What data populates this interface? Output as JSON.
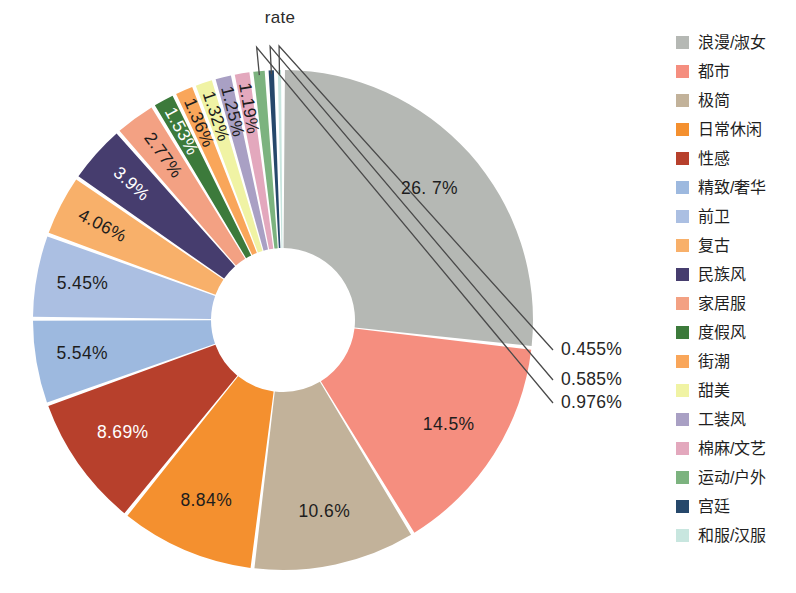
{
  "chart": {
    "title": "rate",
    "center_x": 283,
    "center_y": 320,
    "outer_radius": 250,
    "inner_radius": 72
  },
  "chart_data": {
    "type": "pie",
    "variant": "donut",
    "title": "rate",
    "xlabel": "",
    "ylabel": "",
    "legend_position": "right",
    "grid": false,
    "start_angle_deg": -90,
    "direction": "clockwise",
    "units": "percent",
    "categories": [
      "浪漫/淑女",
      "都市",
      "极简",
      "日常休闲",
      "性感",
      "精致/奢华",
      "前卫",
      "复古",
      "民族风",
      "家居服",
      "度假风",
      "街潮",
      "甜美",
      "工装风",
      "棉麻/文艺",
      "运动/户外",
      "宫廷",
      "和服/汉服"
    ],
    "values": [
      26.7,
      14.5,
      10.6,
      8.84,
      8.69,
      5.54,
      5.45,
      4.06,
      3.9,
      2.77,
      1.53,
      1.36,
      1.32,
      1.25,
      1.19,
      0.976,
      0.585,
      0.455
    ],
    "value_labels": [
      "26. 7%",
      "14.5%",
      "10.6%",
      "8.84%",
      "8.69%",
      "5.54%",
      "5.45%",
      "4.06%",
      "3.9%",
      "2.77%",
      "1.53%",
      "1.36%",
      "1.32%",
      "1.25%",
      "1.19%",
      "0.976%",
      "0.585%",
      "0.455%"
    ],
    "colors": [
      "#b5b8b4",
      "#f58e7f",
      "#c2b29a",
      "#f4902f",
      "#b7402c",
      "#9db9df",
      "#abbfe2",
      "#f8b06a",
      "#463d6e",
      "#f3a183",
      "#3c7a3b",
      "#f9a65a",
      "#f0f3a4",
      "#a9a0c4",
      "#e3a8bd",
      "#7cb37f",
      "#26486b",
      "#c8e6df"
    ],
    "label_placement": [
      "inside",
      "inside",
      "inside",
      "inside",
      "inside",
      "inside",
      "inside",
      "inside",
      "inside",
      "inside",
      "inside",
      "inside",
      "inside",
      "inside",
      "inside",
      "outside",
      "outside",
      "outside"
    ],
    "label_text_color": [
      "dark",
      "dark",
      "dark",
      "dark",
      "light",
      "dark",
      "dark",
      "dark",
      "light",
      "dark",
      "light",
      "dark",
      "dark",
      "dark",
      "dark",
      "dark",
      "dark",
      "dark"
    ]
  },
  "legend": {
    "items": [
      {
        "label": "浪漫/淑女",
        "color": "#b5b8b4"
      },
      {
        "label": "都市",
        "color": "#f58e7f"
      },
      {
        "label": "极简",
        "color": "#c2b29a"
      },
      {
        "label": "日常休闲",
        "color": "#f4902f"
      },
      {
        "label": "性感",
        "color": "#b7402c"
      },
      {
        "label": "精致/奢华",
        "color": "#9db9df"
      },
      {
        "label": "前卫",
        "color": "#abbfe2"
      },
      {
        "label": "复古",
        "color": "#f8b06a"
      },
      {
        "label": "民族风",
        "color": "#463d6e"
      },
      {
        "label": "家居服",
        "color": "#f3a183"
      },
      {
        "label": "度假风",
        "color": "#3c7a3b"
      },
      {
        "label": "街潮",
        "color": "#f9a65a"
      },
      {
        "label": "甜美",
        "color": "#f0f3a4"
      },
      {
        "label": "工装风",
        "color": "#a9a0c4"
      },
      {
        "label": "棉麻/文艺",
        "color": "#e3a8bd"
      },
      {
        "label": "运动/户外",
        "color": "#7cb37f"
      },
      {
        "label": "宫廷",
        "color": "#26486b"
      },
      {
        "label": "和服/汉服",
        "color": "#c8e6df"
      }
    ]
  }
}
